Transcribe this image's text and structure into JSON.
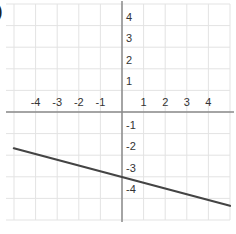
{
  "problem": {
    "marker": ")"
  },
  "chart_data": {
    "type": "line",
    "title": "",
    "xlabel": "",
    "ylabel": "",
    "xlim": [
      -5,
      5
    ],
    "ylim": [
      -5,
      5
    ],
    "grid": true,
    "x_ticks": [
      -4,
      -3,
      -2,
      -1,
      1,
      2,
      3,
      4
    ],
    "y_ticks": [
      4,
      3,
      2,
      1,
      -1,
      -2,
      -3,
      -4
    ],
    "x_tick_labels": [
      "-4",
      "-3",
      "-2",
      "-1",
      "1",
      "2",
      "3",
      "4"
    ],
    "y_tick_labels": [
      "4",
      "3",
      "2",
      "1",
      "-1",
      "-2",
      "-3",
      "-4"
    ],
    "series": [
      {
        "name": "line",
        "equation": "y = -0.25x - 3",
        "slope": -0.25,
        "intercept": -3,
        "x": [
          -5,
          5
        ],
        "y": [
          -1.75,
          -4.25
        ],
        "color": "#444444"
      }
    ],
    "legend": null
  },
  "colors": {
    "grid": "#e3e3e3",
    "axis": "#8a8a8a",
    "line": "#444444"
  }
}
